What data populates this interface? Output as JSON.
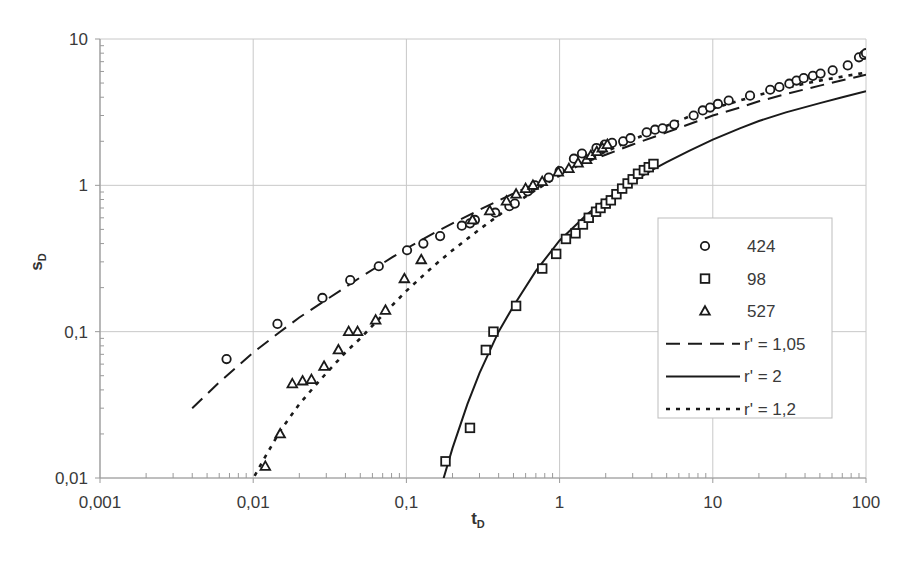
{
  "chart_data": {
    "type": "scatter",
    "title": "",
    "xlabel": "tD",
    "xlabel_main": "t",
    "xlabel_sub": "D",
    "ylabel": "sD",
    "ylabel_main": "s",
    "ylabel_sub": "D",
    "xscale": "log",
    "yscale": "log",
    "xlim": [
      0.001,
      100
    ],
    "ylim": [
      0.01,
      10
    ],
    "grid": true,
    "legend_position": "inside-right",
    "x_tick_labels": [
      "0,001",
      "0,01",
      "0,1",
      "1",
      "10",
      "100"
    ],
    "x_ticks": [
      0.001,
      0.01,
      0.1,
      1,
      10,
      100
    ],
    "y_tick_labels": [
      "0,01",
      "0,1",
      "1",
      "10"
    ],
    "y_ticks": [
      0.01,
      0.1,
      1,
      10
    ],
    "series": [
      {
        "name": "424",
        "kind": "points",
        "marker": "circle",
        "x": [
          0.0067,
          0.0144,
          0.0283,
          0.043,
          0.066,
          0.101,
          0.129,
          0.166,
          0.23,
          0.26,
          0.28,
          0.38,
          0.47,
          0.51,
          0.62,
          0.69,
          0.85,
          1.0,
          1.24,
          1.4,
          1.74,
          1.97,
          2.2,
          2.6,
          2.9,
          3.7,
          4.2,
          4.7,
          5.6,
          7.5,
          8.6,
          9.6,
          10.8,
          12.7,
          17.5,
          23.7,
          27.2,
          31.6,
          35.2,
          39.2,
          45,
          50.5,
          60.6,
          76,
          90,
          97,
          100
        ],
        "y": [
          0.065,
          0.113,
          0.17,
          0.225,
          0.28,
          0.36,
          0.4,
          0.45,
          0.53,
          0.55,
          0.58,
          0.65,
          0.72,
          0.75,
          0.91,
          1.0,
          1.13,
          1.25,
          1.52,
          1.65,
          1.8,
          1.9,
          1.95,
          2.0,
          2.1,
          2.3,
          2.4,
          2.45,
          2.6,
          3.0,
          3.25,
          3.4,
          3.6,
          3.8,
          4.1,
          4.5,
          4.7,
          4.95,
          5.2,
          5.4,
          5.6,
          5.8,
          6.1,
          6.6,
          7.5,
          7.8,
          8.0
        ]
      },
      {
        "name": "98",
        "kind": "points",
        "marker": "square",
        "x": [
          0.18,
          0.26,
          0.33,
          0.37,
          0.52,
          0.77,
          0.95,
          1.1,
          1.27,
          1.42,
          1.55,
          1.73,
          1.85,
          2.0,
          2.16,
          2.35,
          2.56,
          2.78,
          3.0,
          3.25,
          3.55,
          3.82,
          4.1
        ],
        "y": [
          0.013,
          0.022,
          0.075,
          0.1,
          0.15,
          0.27,
          0.34,
          0.43,
          0.47,
          0.54,
          0.6,
          0.66,
          0.7,
          0.75,
          0.79,
          0.87,
          0.95,
          1.03,
          1.1,
          1.2,
          1.27,
          1.33,
          1.4
        ]
      },
      {
        "name": "527",
        "kind": "points",
        "marker": "triangle",
        "x": [
          0.012,
          0.015,
          0.018,
          0.021,
          0.024,
          0.029,
          0.036,
          0.042,
          0.048,
          0.063,
          0.073,
          0.097,
          0.125,
          0.27,
          0.35,
          0.45,
          0.52,
          0.6,
          0.67,
          0.77,
          0.98,
          1.15,
          1.32,
          1.5,
          1.6,
          1.75,
          1.9,
          2.05
        ],
        "y": [
          0.012,
          0.02,
          0.044,
          0.046,
          0.047,
          0.058,
          0.075,
          0.1,
          0.1,
          0.12,
          0.14,
          0.23,
          0.31,
          0.58,
          0.67,
          0.78,
          0.87,
          0.95,
          1.0,
          1.06,
          1.23,
          1.3,
          1.42,
          1.5,
          1.6,
          1.7,
          1.8,
          1.9
        ]
      },
      {
        "name": "r' = 1,05",
        "kind": "line",
        "style": "dashed",
        "x": [
          0.004,
          0.006,
          0.01,
          0.015,
          0.02,
          0.03,
          0.05,
          0.08,
          0.1,
          0.15,
          0.2,
          0.3,
          0.5,
          0.8,
          1,
          1.5,
          2,
          3,
          5,
          8,
          10,
          15,
          20,
          30,
          50,
          80,
          100
        ],
        "y": [
          0.03,
          0.045,
          0.072,
          0.1,
          0.125,
          0.165,
          0.235,
          0.32,
          0.37,
          0.47,
          0.55,
          0.68,
          0.88,
          1.1,
          1.22,
          1.45,
          1.62,
          1.9,
          2.3,
          2.75,
          3.0,
          3.4,
          3.75,
          4.2,
          4.8,
          5.4,
          5.7
        ]
      },
      {
        "name": "r' = 2",
        "kind": "line",
        "style": "solid",
        "x": [
          0.17,
          0.2,
          0.25,
          0.3,
          0.4,
          0.5,
          0.7,
          1,
          1.5,
          2,
          3,
          4,
          5,
          7,
          10,
          15,
          20,
          30,
          50,
          70,
          100
        ],
        "y": [
          0.009,
          0.016,
          0.032,
          0.052,
          0.1,
          0.15,
          0.26,
          0.42,
          0.63,
          0.8,
          1.06,
          1.27,
          1.44,
          1.72,
          2.05,
          2.45,
          2.75,
          3.15,
          3.65,
          4.0,
          4.4
        ]
      },
      {
        "name": "r' = 1,2",
        "kind": "line",
        "style": "dotted",
        "x": [
          0.0095,
          0.012,
          0.015,
          0.02,
          0.025,
          0.03,
          0.04,
          0.05,
          0.07,
          0.1,
          0.15,
          0.2,
          0.3,
          0.5,
          0.7,
          1,
          1.5,
          2,
          3,
          5,
          7,
          10,
          20,
          30,
          50,
          100
        ],
        "y": [
          0.009,
          0.014,
          0.021,
          0.032,
          0.042,
          0.052,
          0.072,
          0.09,
          0.13,
          0.19,
          0.28,
          0.36,
          0.5,
          0.74,
          0.93,
          1.17,
          1.47,
          1.7,
          2.05,
          2.55,
          2.95,
          3.35,
          4.15,
          4.65,
          5.2,
          5.9
        ]
      }
    ]
  },
  "legend": {
    "items": [
      {
        "label": "424",
        "marker": "circle"
      },
      {
        "label": "98",
        "marker": "square"
      },
      {
        "label": "527",
        "marker": "triangle"
      },
      {
        "label": "r' = 1,05",
        "line": "dashed"
      },
      {
        "label": "r' = 2",
        "line": "solid"
      },
      {
        "label": "r' = 1,2",
        "line": "dotted"
      }
    ]
  },
  "colors": {
    "grid": "#c8c8c8",
    "axis": "#9a9a9a",
    "series": "#1a1a1a",
    "text": "#3a3a3a",
    "legend_border": "#bdbdbd"
  }
}
